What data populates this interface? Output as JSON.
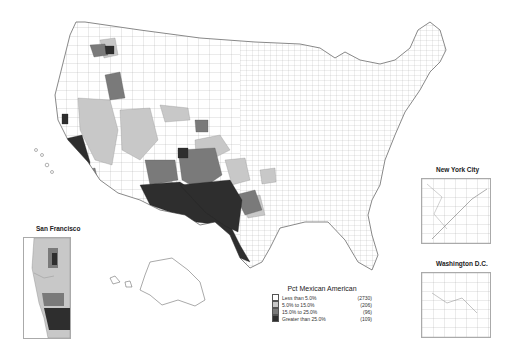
{
  "map": {
    "subject": "Pct Mexican American by county, contiguous United States",
    "insets": [
      {
        "id": "new_york",
        "title": "New York City"
      },
      {
        "id": "washington",
        "title": "Washington D.C."
      },
      {
        "id": "san_francisco",
        "title": "San Francisco"
      }
    ]
  },
  "legend": {
    "title": "Pct Mexican American",
    "items": [
      {
        "label": "Less than 5.0%",
        "count": "(2730)",
        "color": "#ffffff"
      },
      {
        "label": "5.0% to 15.0%",
        "count": "(206)",
        "color": "#c8c8c8"
      },
      {
        "label": "15.0% to 25.0%",
        "count": "(96)",
        "color": "#7a7a7a"
      },
      {
        "label": "Greater than 25.0%",
        "count": "(109)",
        "color": "#2e2e2e"
      }
    ]
  }
}
